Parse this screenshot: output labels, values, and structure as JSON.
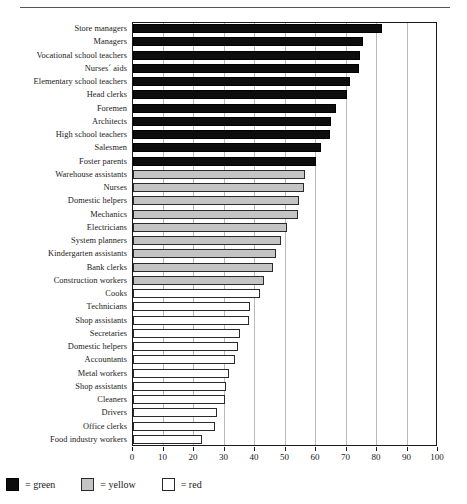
{
  "chart_data": {
    "type": "bar",
    "orientation": "horizontal",
    "title": "",
    "xlabel": "",
    "ylabel": "",
    "xlim": [
      0,
      100
    ],
    "xticks": [
      0,
      10,
      20,
      30,
      40,
      50,
      60,
      70,
      80,
      90,
      100
    ],
    "grid": true,
    "legend_position": "below-left",
    "categories": [
      "Store managers",
      "Managers",
      "Vocational school teachers",
      "Nurses´ aids",
      "Elementary school teachers",
      "Head clerks",
      "Foremen",
      "Architects",
      "High school teachers",
      "Salesmen",
      "Foster parents",
      "Warehouse assistants",
      "Nurses",
      "Domestic helpers",
      "Mechanics",
      "Electricians",
      "System planners",
      "Kindergarten assistants",
      "Bank clerks",
      "Construction workers",
      "Cooks",
      "Technicians",
      "Shop assistants",
      "Secretaries",
      "Domestic helpers",
      "Accountants",
      "Metal workers",
      "Shop assistants",
      "Cleaners",
      "Drivers",
      "Office clerks",
      "Food industry workers"
    ],
    "values": [
      81.5,
      75.5,
      74.5,
      74.0,
      71.0,
      70.0,
      66.5,
      65.0,
      64.5,
      61.5,
      60.0,
      56.5,
      56.0,
      54.5,
      54.0,
      50.5,
      48.5,
      47.0,
      46.0,
      43.0,
      41.5,
      38.5,
      38.0,
      35.0,
      34.5,
      33.5,
      31.5,
      30.5,
      30.0,
      27.5,
      27.0,
      22.5
    ],
    "groups": [
      "green",
      "green",
      "green",
      "green",
      "green",
      "green",
      "green",
      "green",
      "green",
      "green",
      "green",
      "yellow",
      "yellow",
      "yellow",
      "yellow",
      "yellow",
      "yellow",
      "yellow",
      "yellow",
      "yellow",
      "red",
      "red",
      "red",
      "red",
      "red",
      "red",
      "red",
      "red",
      "red",
      "red",
      "red",
      "red"
    ],
    "colors": {
      "green": "#0d0d0d",
      "yellow": "#c4c4c4",
      "red": "#ffffff",
      "axis": "#1a1a1a",
      "grid": "#b9b9b9"
    }
  },
  "legend": {
    "items": [
      {
        "swatch": "green",
        "label": "= green"
      },
      {
        "swatch": "yellow",
        "label": "= yellow"
      },
      {
        "swatch": "red",
        "label": "= red"
      }
    ]
  }
}
